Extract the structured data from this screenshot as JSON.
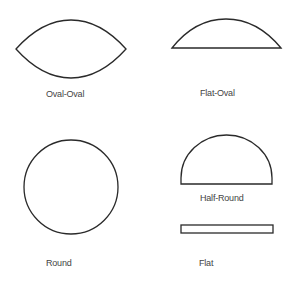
{
  "diagram": {
    "title": "",
    "stroke_color": "#2a2a2a",
    "label_color": "#444444",
    "shapes": [
      {
        "id": "oval-oval",
        "label": "Oval-Oval"
      },
      {
        "id": "flat-oval",
        "label": "Flat-Oval"
      },
      {
        "id": "round",
        "label": "Round"
      },
      {
        "id": "half-round",
        "label": "Half-Round"
      },
      {
        "id": "flat",
        "label": "Flat"
      }
    ]
  }
}
